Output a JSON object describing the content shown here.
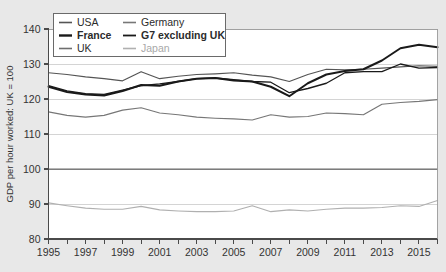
{
  "chart_data": {
    "type": "line",
    "title": "",
    "xlabel": "",
    "ylabel": "GDP per hour worked: UK = 100",
    "xlim": [
      1995,
      2016
    ],
    "ylim": [
      80,
      140
    ],
    "ytick_labels": [
      "80",
      "90",
      "100",
      "110",
      "120",
      "130",
      "140"
    ],
    "ytick_values": [
      80,
      90,
      100,
      110,
      120,
      130,
      140
    ],
    "xtick_labels": [
      "1995",
      "1997",
      "1999",
      "2001",
      "2003",
      "2005",
      "2007",
      "2009",
      "2011",
      "2013",
      "2015"
    ],
    "xtick_values": [
      1995,
      1997,
      1999,
      2001,
      2003,
      2005,
      2007,
      2009,
      2011,
      2013,
      2015
    ],
    "x_minor_ticks": [
      1996,
      1998,
      2000,
      2002,
      2004,
      2006,
      2008,
      2010,
      2012,
      2014,
      2016
    ],
    "grid": true,
    "grid_axis": "y",
    "legend_position": "top-left",
    "x": [
      1995,
      1996,
      1997,
      1998,
      1999,
      2000,
      2001,
      2002,
      2003,
      2004,
      2005,
      2006,
      2007,
      2008,
      2009,
      2010,
      2011,
      2012,
      2013,
      2014,
      2015,
      2016
    ],
    "series": [
      {
        "name": "USA",
        "color": "#555555",
        "width": 1.2,
        "values": [
          127.5,
          127.0,
          126.3,
          125.8,
          125.2,
          127.8,
          125.8,
          126.5,
          127.0,
          127.2,
          127.5,
          126.8,
          126.3,
          125.0,
          127.0,
          128.5,
          128.3,
          128.5,
          128.8,
          129.2,
          129.5,
          129.3
        ]
      },
      {
        "name": "France",
        "color": "#1a1a1a",
        "width": 2.0,
        "values": [
          123.5,
          122.0,
          121.3,
          121.0,
          122.3,
          124.0,
          123.8,
          125.0,
          125.8,
          126.0,
          125.3,
          125.0,
          123.5,
          120.8,
          124.5,
          127.0,
          128.0,
          128.5,
          131.0,
          134.5,
          135.5,
          134.8
        ]
      },
      {
        "name": "UK",
        "color": "#6e6e6e",
        "width": 1.2,
        "values": [
          100,
          100,
          100,
          100,
          100,
          100,
          100,
          100,
          100,
          100,
          100,
          100,
          100,
          100,
          100,
          100,
          100,
          100,
          100,
          100,
          100,
          100
        ]
      },
      {
        "name": "Germany",
        "color": "#777777",
        "width": 1.2,
        "values": [
          116.3,
          115.3,
          114.8,
          115.3,
          116.8,
          117.5,
          116.0,
          115.5,
          114.8,
          114.5,
          114.3,
          114.0,
          115.5,
          114.8,
          115.0,
          116.0,
          115.8,
          115.5,
          118.5,
          119.0,
          119.3,
          119.8
        ]
      },
      {
        "name": "G7 excluding UK",
        "color": "#1a1a1a",
        "width": 1.3,
        "values": [
          123.8,
          122.3,
          121.5,
          121.3,
          122.5,
          123.8,
          124.3,
          125.0,
          125.8,
          126.0,
          125.5,
          125.0,
          124.8,
          121.8,
          123.0,
          124.5,
          127.5,
          127.8,
          127.8,
          130.0,
          128.8,
          129.0
        ]
      },
      {
        "name": "Japan",
        "color": "#b0b0b0",
        "width": 1.2,
        "values": [
          90.3,
          89.5,
          88.8,
          88.5,
          88.5,
          89.3,
          88.3,
          88.0,
          87.8,
          87.8,
          88.0,
          89.5,
          87.8,
          88.3,
          88.0,
          88.5,
          88.8,
          88.8,
          89.0,
          89.5,
          89.3,
          91.0
        ]
      }
    ]
  },
  "legend": {
    "entries": [
      {
        "label": "USA",
        "key": "usa",
        "color": "#555555",
        "bold": false,
        "width": 1.6
      },
      {
        "label": "Germany",
        "key": "germany",
        "color": "#777777",
        "bold": false,
        "width": 1.6
      },
      {
        "label": "France",
        "key": "france",
        "color": "#1a1a1a",
        "bold": true,
        "width": 2.4
      },
      {
        "label": "G7 excluding UK",
        "key": "g7-excluding-uk",
        "color": "#1a1a1a",
        "bold": true,
        "width": 1.8
      },
      {
        "label": "UK",
        "key": "uk",
        "color": "#6e6e6e",
        "bold": false,
        "width": 1.6
      },
      {
        "label": "Japan",
        "key": "japan",
        "color": "#b0b0b0",
        "bold": false,
        "width": 1.6
      }
    ]
  },
  "colors": {
    "background": "#e8e8e8",
    "plot_background": "#ffffff",
    "axis": "#4a4a4a",
    "grid": "#c9c9c9",
    "text": "#333333"
  }
}
